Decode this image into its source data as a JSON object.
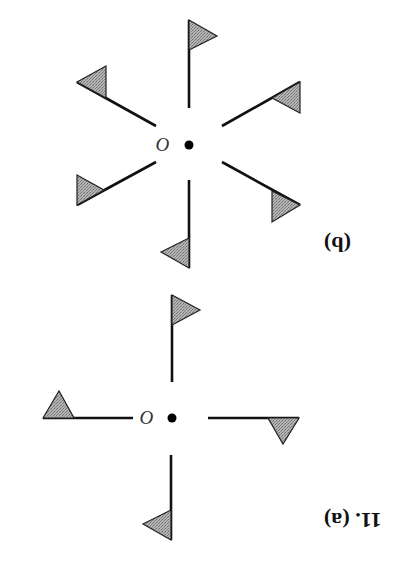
{
  "figure": {
    "orientation": "rotated 180 degrees (upside down)",
    "problem_number": "11.",
    "labels": {
      "a": "11. (a)",
      "b": "(b)"
    },
    "origin_symbol": "O",
    "colors": {
      "line": "#111111",
      "flag_fill": "#a8a8a8",
      "flag_stroke": "#222222",
      "background": "#ffffff"
    }
  },
  "panel_a": {
    "label": "(a)",
    "center": [
      172,
      418
    ],
    "arm_count": 4,
    "symmetry": "4-fold rotational (pinwheel)",
    "arms": [
      {
        "name": "up",
        "line": [
          [
            172,
            295
          ],
          [
            172,
            382
          ]
        ],
        "flag": [
          [
            172,
            295
          ],
          [
            200,
            310
          ],
          [
            172,
            325
          ]
        ]
      },
      {
        "name": "left",
        "line": [
          [
            43,
            418
          ],
          [
            133,
            418
          ]
        ],
        "flag": [
          [
            43,
            418
          ],
          [
            59,
            391
          ],
          [
            74,
            418
          ]
        ]
      },
      {
        "name": "right",
        "line": [
          [
            208,
            418
          ],
          [
            299,
            418
          ]
        ],
        "flag": [
          [
            268,
            418
          ],
          [
            299,
            418
          ],
          [
            283,
            444
          ]
        ]
      },
      {
        "name": "down",
        "line": [
          [
            171,
            455
          ],
          [
            171,
            540
          ]
        ],
        "flag": [
          [
            171,
            510
          ],
          [
            143,
            524
          ],
          [
            171,
            540
          ]
        ]
      }
    ]
  },
  "panel_b": {
    "label": "(b)",
    "center": [
      189,
      145
    ],
    "arm_count": 6,
    "symmetry": "6-fold rotational (pinwheel)",
    "arms": [
      {
        "name": "up",
        "line": [
          [
            189,
            20
          ],
          [
            189,
            108
          ]
        ],
        "flag": [
          [
            189,
            20
          ],
          [
            217,
            36
          ],
          [
            189,
            50
          ]
        ]
      },
      {
        "name": "upper-left",
        "line": [
          [
            77,
            82
          ],
          [
            156,
            126
          ]
        ],
        "flag": [
          [
            77,
            82
          ],
          [
            106,
            66
          ],
          [
            106,
            98
          ]
        ]
      },
      {
        "name": "upper-right",
        "line": [
          [
            222,
            126
          ],
          [
            300,
            82
          ]
        ],
        "flag": [
          [
            300,
            82
          ],
          [
            300,
            113
          ],
          [
            272,
            98
          ]
        ]
      },
      {
        "name": "lower-left",
        "line": [
          [
            156,
            162
          ],
          [
            77,
            205
          ]
        ],
        "flag": [
          [
            77,
            175
          ],
          [
            77,
            205
          ],
          [
            104,
            190
          ]
        ]
      },
      {
        "name": "lower-right",
        "line": [
          [
            222,
            162
          ],
          [
            300,
            205
          ]
        ],
        "flag": [
          [
            272,
            191
          ],
          [
            300,
            205
          ],
          [
            272,
            222
          ]
        ]
      },
      {
        "name": "down",
        "line": [
          [
            189,
            180
          ],
          [
            189,
            268
          ]
        ],
        "flag": [
          [
            189,
            238
          ],
          [
            161,
            252
          ],
          [
            189,
            268
          ]
        ]
      }
    ]
  }
}
